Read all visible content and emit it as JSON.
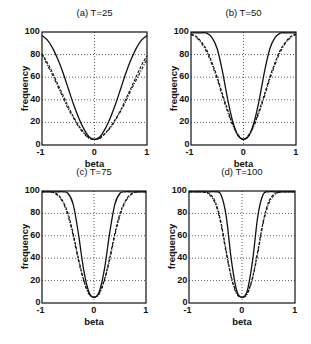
{
  "chart_data": [
    {
      "type": "line",
      "title": "(a) T=25",
      "xlabel": "beta",
      "ylabel": "frequency",
      "xlim": [
        -1,
        1
      ],
      "ylim": [
        0,
        100
      ],
      "xticks": [
        "-1",
        "0",
        "1"
      ],
      "yticks": [
        "0",
        "20",
        "40",
        "60",
        "80",
        "100"
      ],
      "grid": true,
      "x": [
        -1,
        -0.9,
        -0.8,
        -0.7,
        -0.6,
        -0.5,
        -0.4,
        -0.3,
        -0.2,
        -0.1,
        0,
        0.1,
        0.2,
        0.3,
        0.4,
        0.5,
        0.6,
        0.7,
        0.8,
        0.9,
        1
      ],
      "series": [
        {
          "name": "solid",
          "style": "solid",
          "values": [
            97,
            93,
            86,
            76,
            64,
            50,
            36,
            24,
            14,
            7,
            5,
            7,
            14,
            24,
            36,
            50,
            64,
            76,
            86,
            93,
            97
          ]
        },
        {
          "name": "dashed",
          "style": "dashed",
          "values": [
            81,
            73,
            64,
            54,
            44,
            34,
            25,
            17,
            11,
            6,
            5,
            6,
            10,
            16,
            23,
            31,
            41,
            51,
            61,
            71,
            79
          ]
        },
        {
          "name": "dashdot",
          "style": "dashdot",
          "values": [
            80,
            71,
            62,
            52,
            42,
            32,
            24,
            16,
            10,
            6,
            5,
            6,
            10,
            15,
            22,
            30,
            39,
            49,
            58,
            67,
            76
          ]
        }
      ]
    },
    {
      "type": "line",
      "title": "(b) T=50",
      "xlabel": "beta",
      "ylabel": "frequency",
      "xlim": [
        -1,
        1
      ],
      "ylim": [
        0,
        100
      ],
      "xticks": [
        "-1",
        "0",
        "1"
      ],
      "yticks": [
        "0",
        "20",
        "40",
        "60",
        "80",
        "100"
      ],
      "grid": true,
      "x": [
        -1,
        -0.9,
        -0.8,
        -0.7,
        -0.6,
        -0.5,
        -0.4,
        -0.3,
        -0.2,
        -0.1,
        0,
        0.1,
        0.2,
        0.3,
        0.4,
        0.5,
        0.6,
        0.7,
        0.8,
        0.9,
        1
      ],
      "series": [
        {
          "name": "solid",
          "style": "solid",
          "values": [
            100,
            100,
            100,
            99,
            95,
            85,
            65,
            40,
            20,
            8,
            5,
            8,
            20,
            40,
            65,
            85,
            95,
            99,
            100,
            100,
            100
          ]
        },
        {
          "name": "dashed",
          "style": "dashed",
          "values": [
            98,
            96,
            91,
            84,
            73,
            60,
            45,
            31,
            18,
            9,
            5,
            9,
            18,
            31,
            45,
            60,
            73,
            84,
            91,
            96,
            98
          ]
        },
        {
          "name": "dashdot",
          "style": "dashdot",
          "values": [
            98,
            95,
            90,
            82,
            71,
            58,
            43,
            29,
            17,
            8,
            5,
            8,
            17,
            29,
            43,
            58,
            71,
            82,
            90,
            95,
            98
          ]
        }
      ]
    },
    {
      "type": "line",
      "title": "(c) T=75",
      "xlabel": "beta",
      "ylabel": "frequency",
      "xlim": [
        -1,
        1
      ],
      "ylim": [
        0,
        100
      ],
      "xticks": [
        "-1",
        "0",
        "1"
      ],
      "yticks": [
        "0",
        "20",
        "40",
        "60",
        "80",
        "100"
      ],
      "grid": true,
      "x": [
        -1,
        -0.9,
        -0.8,
        -0.7,
        -0.6,
        -0.5,
        -0.4,
        -0.3,
        -0.2,
        -0.1,
        0,
        0.1,
        0.2,
        0.3,
        0.4,
        0.5,
        0.6,
        0.7,
        0.8,
        0.9,
        1
      ],
      "series": [
        {
          "name": "solid",
          "style": "solid",
          "values": [
            100,
            100,
            100,
            100,
            100,
            98,
            88,
            62,
            30,
            10,
            5,
            10,
            30,
            62,
            88,
            98,
            100,
            100,
            100,
            100,
            100
          ]
        },
        {
          "name": "dashed",
          "style": "dashed",
          "values": [
            100,
            100,
            99,
            97,
            91,
            80,
            62,
            40,
            21,
            9,
            5,
            9,
            21,
            40,
            62,
            80,
            91,
            97,
            99,
            100,
            100
          ]
        },
        {
          "name": "dashdot",
          "style": "dashdot",
          "values": [
            100,
            100,
            99,
            96,
            90,
            78,
            60,
            38,
            20,
            8,
            5,
            8,
            20,
            38,
            60,
            78,
            90,
            96,
            99,
            100,
            100
          ]
        }
      ]
    },
    {
      "type": "line",
      "title": "(d) T=100",
      "xlabel": "beta",
      "ylabel": "frequency",
      "xlim": [
        -1,
        1
      ],
      "ylim": [
        0,
        100
      ],
      "xticks": [
        "-1",
        "0",
        "1"
      ],
      "yticks": [
        "0",
        "20",
        "40",
        "60",
        "80",
        "100"
      ],
      "grid": true,
      "x": [
        -1,
        -0.9,
        -0.8,
        -0.7,
        -0.6,
        -0.5,
        -0.4,
        -0.3,
        -0.2,
        -0.1,
        0,
        0.1,
        0.2,
        0.3,
        0.4,
        0.5,
        0.6,
        0.7,
        0.8,
        0.9,
        1
      ],
      "series": [
        {
          "name": "solid",
          "style": "solid",
          "values": [
            100,
            100,
            100,
            100,
            100,
            100,
            97,
            78,
            38,
            11,
            5,
            11,
            38,
            78,
            97,
            100,
            100,
            100,
            100,
            100,
            100
          ]
        },
        {
          "name": "dashed",
          "style": "dashed",
          "values": [
            100,
            100,
            100,
            99,
            97,
            90,
            73,
            47,
            23,
            9,
            5,
            9,
            23,
            47,
            73,
            90,
            97,
            99,
            100,
            100,
            100
          ]
        },
        {
          "name": "dashdot",
          "style": "dashdot",
          "values": [
            100,
            100,
            100,
            99,
            96,
            88,
            71,
            45,
            22,
            8,
            5,
            8,
            22,
            45,
            71,
            88,
            96,
            99,
            100,
            100,
            100
          ]
        }
      ]
    }
  ]
}
